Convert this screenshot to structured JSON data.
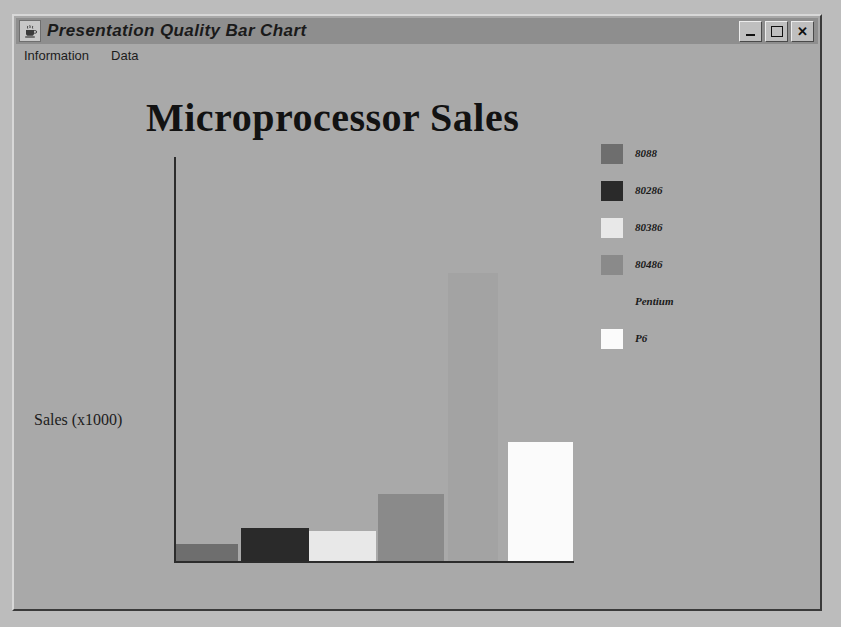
{
  "window": {
    "title": "Presentation Quality Bar Chart",
    "icon": "java-coffee-cup-icon",
    "controls": {
      "minimize": "minimize-button",
      "maximize": "maximize-button",
      "close": "close-button"
    },
    "menu": [
      {
        "label": "Information"
      },
      {
        "label": "Data"
      }
    ]
  },
  "colors": {
    "window_face": "#a9a9a9",
    "titlebar": "#8e8e8e",
    "page_background": "#bcbcbc",
    "axis": "#2c2c2c",
    "text": "#1a1a1a"
  },
  "chart_data": {
    "type": "bar",
    "title": "Microprocessor Sales",
    "xlabel": "Processor",
    "ylabel": "Sales (x1000)",
    "grid": false,
    "legend_position": "right",
    "categories": [
      "8088",
      "80286",
      "80386",
      "80486",
      "Pentium",
      "P6"
    ],
    "values": [
      17,
      33,
      30,
      67,
      288,
      119
    ],
    "ylim": [
      0,
      404
    ],
    "colors": [
      "#6e6e6e",
      "#2a2a2a",
      "#e8e8e8",
      "#8a8a8a",
      "#a3a3a3",
      "#fbfbfb"
    ],
    "bar_geometry": [
      {
        "left": 0,
        "width": 62
      },
      {
        "left": 65,
        "width": 68
      },
      {
        "left": 133,
        "width": 67
      },
      {
        "left": 202,
        "width": 66
      },
      {
        "left": 272,
        "width": 50
      },
      {
        "left": 332,
        "width": 65
      }
    ],
    "legend": [
      {
        "label": "8088",
        "color": "#6e6e6e"
      },
      {
        "label": "80286",
        "color": "#2a2a2a"
      },
      {
        "label": "80386",
        "color": "#e8e8e8"
      },
      {
        "label": "80486",
        "color": "#8a8a8a"
      },
      {
        "label": "Pentium",
        "color": "#a9a9a9"
      },
      {
        "label": "P6",
        "color": "#fbfbfb"
      }
    ]
  }
}
